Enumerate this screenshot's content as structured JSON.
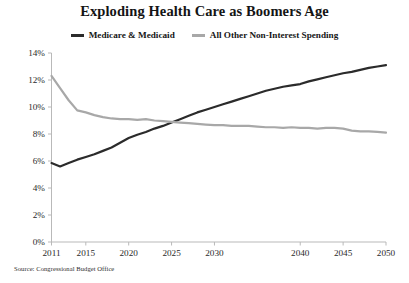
{
  "chart_data": {
    "type": "line",
    "title": "Exploding Health Care as Boomers Age",
    "xlabel": "",
    "ylabel": "",
    "source": "Source: Congressional Budget Office",
    "grid": false,
    "legend_position": "top-center",
    "xlim": [
      2011,
      2050
    ],
    "ylim": [
      0,
      14
    ],
    "ytick_labels": [
      "0%",
      "2%",
      "4%",
      "6%",
      "8%",
      "10%",
      "12%",
      "14%"
    ],
    "ytick_values": [
      0,
      2,
      4,
      6,
      8,
      10,
      12,
      14
    ],
    "xtick_labels": [
      "2011",
      "2015",
      "2020",
      "2025",
      "2030",
      "2040",
      "2045",
      "2050"
    ],
    "xtick_values": [
      2011,
      2015,
      2020,
      2025,
      2030,
      2040,
      2045,
      2050
    ],
    "y_unit": "percent of GDP",
    "x": [
      2011,
      2012,
      2013,
      2014,
      2015,
      2016,
      2017,
      2018,
      2019,
      2020,
      2021,
      2022,
      2023,
      2024,
      2025,
      2026,
      2027,
      2028,
      2029,
      2030,
      2031,
      2032,
      2033,
      2034,
      2035,
      2036,
      2037,
      2038,
      2039,
      2040,
      2041,
      2042,
      2043,
      2044,
      2045,
      2046,
      2047,
      2048,
      2049,
      2050
    ],
    "series": [
      {
        "name": "Medicare & Medicaid",
        "color": "#2b2b2b",
        "values": [
          5.85,
          5.6,
          5.85,
          6.1,
          6.3,
          6.5,
          6.75,
          7.0,
          7.35,
          7.7,
          7.95,
          8.15,
          8.4,
          8.6,
          8.85,
          9.1,
          9.35,
          9.6,
          9.8,
          10.0,
          10.2,
          10.4,
          10.6,
          10.8,
          11.0,
          11.2,
          11.35,
          11.5,
          11.6,
          11.7,
          11.9,
          12.05,
          12.2,
          12.35,
          12.5,
          12.6,
          12.75,
          12.9,
          13.0,
          13.1
        ]
      },
      {
        "name": "All Other Non-Interest Spending",
        "color": "#a8a8a8",
        "values": [
          12.3,
          11.4,
          10.5,
          9.75,
          9.6,
          9.4,
          9.25,
          9.15,
          9.1,
          9.1,
          9.05,
          9.1,
          9.0,
          8.95,
          8.9,
          8.85,
          8.8,
          8.75,
          8.7,
          8.65,
          8.65,
          8.6,
          8.6,
          8.6,
          8.55,
          8.5,
          8.5,
          8.45,
          8.5,
          8.45,
          8.45,
          8.4,
          8.45,
          8.45,
          8.4,
          8.25,
          8.2,
          8.2,
          8.15,
          8.1
        ]
      }
    ]
  }
}
